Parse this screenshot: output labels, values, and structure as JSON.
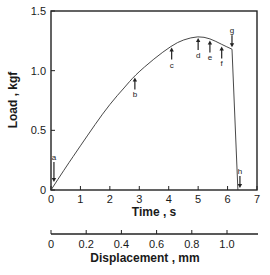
{
  "chart_data": {
    "type": "line",
    "title": "",
    "xlabel": "Time , s",
    "ylabel": "Load , kgf",
    "secondary_xlabel": "Displacement , mm",
    "xlim": [
      0,
      7
    ],
    "ylim": [
      0,
      1.5
    ],
    "secondary_xlim": [
      0,
      1.18
    ],
    "x_ticks": [
      "0",
      "1",
      "2",
      "3",
      "4",
      "5",
      "6",
      "7"
    ],
    "y_ticks": [
      "0",
      "0.5",
      "1.0",
      "1.5"
    ],
    "secondary_x_ticks": [
      "0",
      "0.2",
      "0.4",
      "0.6",
      "0.8",
      "1.0"
    ],
    "grid": false,
    "legend": null,
    "series": [
      {
        "name": "Load vs Time",
        "x": [
          0,
          0.5,
          1.0,
          1.5,
          2.0,
          2.5,
          2.85,
          3.5,
          4.1,
          4.5,
          5.0,
          5.4,
          5.8,
          6.15,
          6.35
        ],
        "y": [
          0,
          0.19,
          0.37,
          0.55,
          0.72,
          0.86,
          0.96,
          1.1,
          1.21,
          1.26,
          1.29,
          1.27,
          1.22,
          1.18,
          0
        ]
      }
    ],
    "annotations": [
      {
        "label": "a",
        "t": 0.1,
        "load": 0.0,
        "arrow": "down"
      },
      {
        "label": "b",
        "t": 2.85,
        "load": 0.96,
        "arrow": "up"
      },
      {
        "label": "c",
        "t": 4.1,
        "load": 1.21,
        "arrow": "up"
      },
      {
        "label": "d",
        "t": 5.0,
        "load": 1.29,
        "arrow": "up"
      },
      {
        "label": "e",
        "t": 5.4,
        "load": 1.27,
        "arrow": "up"
      },
      {
        "label": "f",
        "t": 5.8,
        "load": 1.22,
        "arrow": "up"
      },
      {
        "label": "g",
        "t": 6.15,
        "load": 1.18,
        "arrow": "down"
      },
      {
        "label": "h",
        "t": 6.4,
        "load": 0.0,
        "arrow": "down"
      }
    ]
  },
  "labels": {
    "ylabel": "Load , kgf",
    "xlabel": "Time , s",
    "secondary_xlabel": "Displacement , mm"
  }
}
